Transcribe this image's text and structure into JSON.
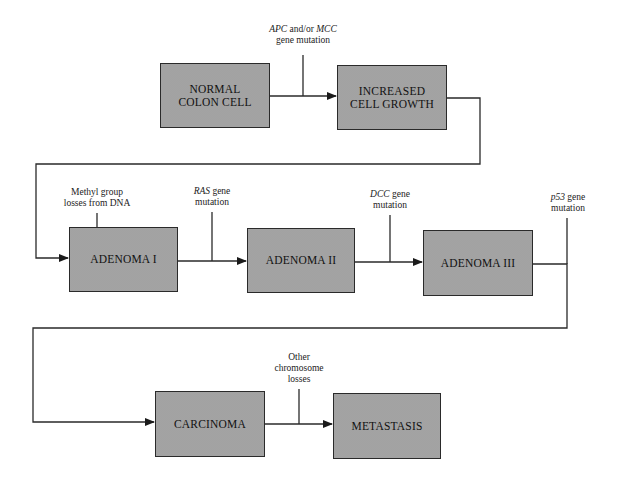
{
  "diagram": {
    "type": "flowchart",
    "boxes": {
      "normal": {
        "line1": "NORMAL",
        "line2": "COLON CELL"
      },
      "increased": {
        "line1": "INCREASED",
        "line2": "CELL GROWTH"
      },
      "adenoma1": {
        "line1": "ADENOMA I"
      },
      "adenoma2": {
        "line1": "ADENOMA II"
      },
      "adenoma3": {
        "line1": "ADENOMA III"
      },
      "carcinoma": {
        "line1": "CARCINOMA"
      },
      "metastasis": {
        "line1": "METASTASIS"
      }
    },
    "labels": {
      "apc": {
        "gene1": "APC",
        "mid": " and/or ",
        "gene2": "MCC",
        "line2": "gene mutation"
      },
      "methyl": {
        "line1": "Methyl group",
        "line2": "losses from DNA"
      },
      "ras": {
        "gene": "RAS",
        "rest": " gene",
        "line2": "mutation"
      },
      "dcc": {
        "gene": "DCC",
        "rest": " gene",
        "line2": "mutation"
      },
      "p53": {
        "gene": "p53",
        "rest": " gene",
        "line2": "mutation"
      },
      "other": {
        "line1": "Other",
        "line2": "chromosome",
        "line3": "losses"
      }
    },
    "colors": {
      "box_fill": "#cfcfcf",
      "line": "#2a2a2a",
      "background": "#ffffff"
    }
  }
}
